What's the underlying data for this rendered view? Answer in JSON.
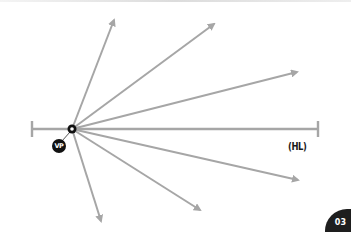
{
  "diagram": {
    "vanishing_point": {
      "label": "VP",
      "x": 72,
      "y": 129
    },
    "horizon_line": {
      "label": "(HL)",
      "x1": 32,
      "x2": 318,
      "y": 129
    },
    "line_color": "#a6a6a6",
    "rays": [
      {
        "id": "ray-1",
        "x2": 114,
        "y2": 20
      },
      {
        "id": "ray-2",
        "x2": 214,
        "y2": 24
      },
      {
        "id": "ray-3",
        "x2": 297,
        "y2": 72
      },
      {
        "id": "ray-4",
        "x2": 298,
        "y2": 180
      },
      {
        "id": "ray-5",
        "x2": 200,
        "y2": 210
      },
      {
        "id": "ray-6",
        "x2": 101,
        "y2": 221
      }
    ]
  },
  "labels": {
    "vp": "VP",
    "hl": "(HL)"
  },
  "page": {
    "number": "03"
  }
}
